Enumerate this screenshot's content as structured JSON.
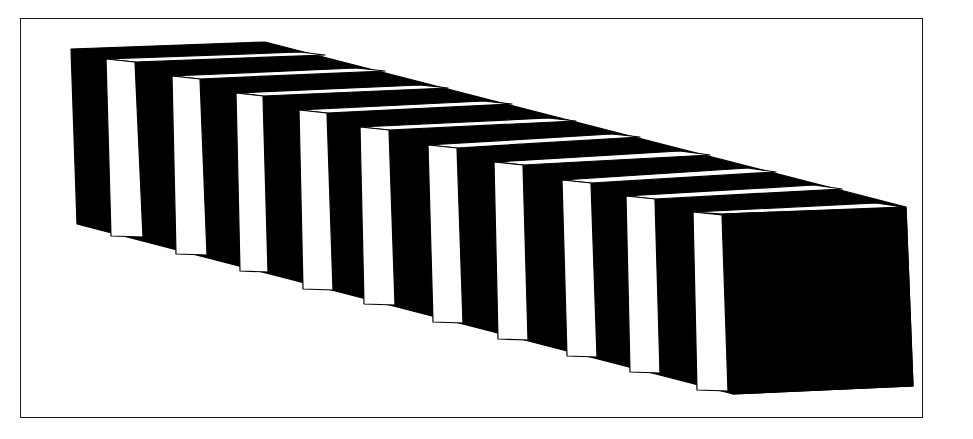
{
  "figure": {
    "colors": {
      "background": "#ffffff",
      "ink": "#000000",
      "frame": "#1a1a1a"
    },
    "frame": {
      "x": 20,
      "y": 18,
      "width": 903,
      "height": 400
    },
    "bar": {
      "silhouette": [
        [
          71,
          49
        ],
        [
          265,
          42
        ],
        [
          906,
          207
        ],
        [
          913,
          386
        ],
        [
          733,
          394
        ],
        [
          77,
          224
        ]
      ],
      "front_face": [
        [
          723,
          214
        ],
        [
          906,
          208
        ],
        [
          913,
          386
        ],
        [
          733,
          394
        ]
      ],
      "side_stripes": [
        {
          "tl": [
            106,
            59
          ],
          "tr": [
            135,
            62
          ],
          "br": [
            143,
            237
          ],
          "bl": [
            111,
            236
          ]
        },
        {
          "tl": [
            172,
            76
          ],
          "tr": [
            200,
            79
          ],
          "br": [
            207,
            255
          ],
          "bl": [
            176,
            254
          ]
        },
        {
          "tl": [
            236,
            93
          ],
          "tr": [
            263,
            96
          ],
          "br": [
            268,
            272
          ],
          "bl": [
            240,
            271
          ]
        },
        {
          "tl": [
            299,
            110
          ],
          "tr": [
            327,
            113
          ],
          "br": [
            333,
            290
          ],
          "bl": [
            303,
            289
          ]
        },
        {
          "tl": [
            360,
            127
          ],
          "tr": [
            389,
            130
          ],
          "br": [
            395,
            305
          ],
          "bl": [
            364,
            304
          ]
        },
        {
          "tl": [
            428,
            145
          ],
          "tr": [
            457,
            148
          ],
          "br": [
            463,
            323
          ],
          "bl": [
            433,
            322
          ]
        },
        {
          "tl": [
            494,
            162
          ],
          "tr": [
            523,
            165
          ],
          "br": [
            528,
            340
          ],
          "bl": [
            498,
            339
          ]
        },
        {
          "tl": [
            562,
            180
          ],
          "tr": [
            591,
            183
          ],
          "br": [
            597,
            357
          ],
          "bl": [
            567,
            356
          ]
        },
        {
          "tl": [
            626,
            196
          ],
          "tr": [
            655,
            199
          ],
          "br": [
            660,
            373
          ],
          "bl": [
            630,
            372
          ]
        },
        {
          "tl": [
            693,
            212
          ],
          "tr": [
            722,
            215
          ],
          "br": [
            728,
            391
          ],
          "bl": [
            697,
            390
          ]
        }
      ],
      "top_bands": [
        [
          [
            106,
            59
          ],
          [
            135,
            62
          ],
          [
            325,
            55
          ],
          [
            300,
            52
          ]
        ],
        [
          [
            172,
            76
          ],
          [
            200,
            79
          ],
          [
            385,
            71
          ],
          [
            356,
            68
          ]
        ],
        [
          [
            236,
            93
          ],
          [
            263,
            96
          ],
          [
            448,
            88
          ],
          [
            420,
            85
          ]
        ],
        [
          [
            299,
            110
          ],
          [
            327,
            113
          ],
          [
            512,
            104
          ],
          [
            484,
            101
          ]
        ],
        [
          [
            360,
            127
          ],
          [
            389,
            130
          ],
          [
            576,
            121
          ],
          [
            548,
            118
          ]
        ],
        [
          [
            428,
            145
          ],
          [
            457,
            148
          ],
          [
            640,
            137
          ],
          [
            612,
            134
          ]
        ],
        [
          [
            494,
            162
          ],
          [
            523,
            165
          ],
          [
            710,
            155
          ],
          [
            680,
            151
          ]
        ],
        [
          [
            562,
            180
          ],
          [
            591,
            183
          ],
          [
            776,
            172
          ],
          [
            748,
            168
          ]
        ],
        [
          [
            626,
            196
          ],
          [
            655,
            199
          ],
          [
            842,
            189
          ],
          [
            814,
            185
          ]
        ],
        [
          [
            693,
            212
          ],
          [
            723,
            214
          ],
          [
            903,
            207
          ],
          [
            876,
            203
          ]
        ]
      ]
    }
  }
}
